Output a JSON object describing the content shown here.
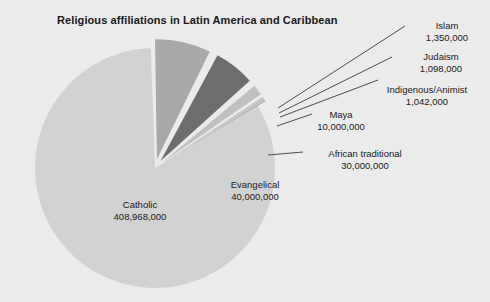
{
  "chart": {
    "title": "Religious affiliations in Latin America and Caribbean"
  },
  "chart_data": {
    "type": "pie",
    "title": "Religious affiliations in Latin America and Caribbean",
    "xlabel": "",
    "ylabel": "",
    "legend_position": "none",
    "grid": false,
    "labels_show_value": true,
    "total": 492458000,
    "categories": [
      "Catholic",
      "Evangelical",
      "African traditional",
      "Maya",
      "Indigenous/Animist",
      "Judaism",
      "Islam"
    ],
    "values": [
      408968000,
      40000000,
      30000000,
      10000000,
      1042000,
      1098000,
      1350000
    ],
    "value_labels": [
      "408,968,000",
      "40,000,000",
      "30,000,000",
      "10,000,000",
      "1,042,000",
      "1,098,000",
      "1,350,000"
    ],
    "slice_colors": [
      "#d2d2d2",
      "#a9a9a9",
      "#6d6d6d",
      "#c0c0c0",
      "#b8b8b8",
      "#b0b0b0",
      "#a8a8a8"
    ],
    "slices": [
      {
        "name": "Catholic",
        "value": 408968000,
        "value_label": "408,968,000",
        "color": "#d2d2d2",
        "exploded": false
      },
      {
        "name": "Evangelical",
        "value": 40000000,
        "value_label": "40,000,000",
        "color": "#a9a9a9",
        "exploded": true
      },
      {
        "name": "African traditional",
        "value": 30000000,
        "value_label": "30,000,000",
        "color": "#6d6d6d",
        "exploded": true
      },
      {
        "name": "Maya",
        "value": 10000000,
        "value_label": "10,000,000",
        "color": "#c0c0c0",
        "exploded": true
      },
      {
        "name": "Indigenous/Animist",
        "value": 1042000,
        "value_label": "1,042,000",
        "color": "#b8b8b8",
        "exploded": true
      },
      {
        "name": "Judaism",
        "value": 1098000,
        "value_label": "1,098,000",
        "color": "#b0b0b0",
        "exploded": true
      },
      {
        "name": "Islam",
        "value": 1350000,
        "value_label": "1,350,000",
        "color": "#a8a8a8",
        "exploded": true
      }
    ]
  },
  "background_color": "#ebebeb",
  "separator_color": "#f2f2f2",
  "leader_line_color": "#4d4d4d"
}
